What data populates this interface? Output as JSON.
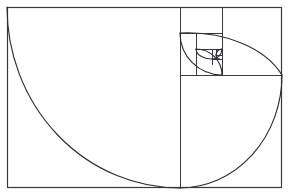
{
  "figure": {
    "background_color": "#ffffff",
    "line_color": "#3a3a3e",
    "spiral_color": "#2e2e33",
    "canvas": {
      "width": 289,
      "height": 196
    }
  },
  "chart_data": {
    "type": "diagram",
    "subtitle": "",
    "xlabel": "",
    "ylabel": "",
    "grid": false,
    "legend": "none",
    "ratio": 1.618,
    "outer_rect": {
      "x": 7,
      "y": 7,
      "width": 275,
      "height": 181
    },
    "squares": [
      {
        "index": 0,
        "x": 180,
        "y": 7,
        "size": 102,
        "corner": "bottom-left",
        "arc_from": [
          7,
          7
        ],
        "arc_to": [
          180,
          188
        ]
      },
      {
        "index": 1,
        "x": 180,
        "y": 7,
        "size": 42,
        "corner": "bottom-right",
        "arc_from": [
          180,
          188
        ],
        "arc_to": [
          282,
          75
        ]
      },
      {
        "index": 2,
        "x": 180,
        "y": 33,
        "size": 42,
        "corner": "top-right",
        "arc_from": [
          282,
          75
        ],
        "arc_to": [
          180,
          33
        ]
      },
      {
        "index": 3,
        "x": 196,
        "y": 33,
        "size": 26,
        "corner": "top-left",
        "arc_from": [
          180,
          33
        ],
        "arc_to": [
          222,
          75
        ]
      },
      {
        "index": 4,
        "x": 196,
        "y": 49,
        "size": 26,
        "corner": "bottom-left",
        "arc_from": [
          222,
          75
        ],
        "arc_to": [
          196,
          49
        ]
      },
      {
        "index": 5,
        "x": 196,
        "y": 49,
        "size": 16,
        "corner": "bottom-right",
        "arc_from": [
          196,
          49
        ],
        "arc_to": [
          222,
          59
        ]
      },
      {
        "index": 6,
        "x": 212,
        "y": 49,
        "size": 10,
        "corner": "top-right",
        "arc_from": [
          222,
          59
        ],
        "arc_to": [
          212,
          49
        ]
      },
      {
        "index": 7,
        "x": 212,
        "y": 55,
        "size": 6,
        "corner": "top-left",
        "arc_from": [
          212,
          49
        ],
        "arc_to": [
          222,
          59
        ]
      },
      {
        "index": 8,
        "x": 216,
        "y": 55,
        "size": 4,
        "corner": "bottom-left",
        "arc_from": [
          222,
          59
        ],
        "arc_to": [
          216,
          55
        ]
      }
    ],
    "divider_lines": [
      {
        "name": "main-vertical-divider",
        "x1": 180,
        "y1": 7,
        "x2": 180,
        "y2": 188
      },
      {
        "name": "right-square-horizontal-divider",
        "x1": 180,
        "y1": 75,
        "x2": 282,
        "y2": 75
      },
      {
        "name": "upper-vertical-divider",
        "x1": 222,
        "y1": 7,
        "x2": 222,
        "y2": 75
      },
      {
        "name": "inner-horizontal-divider",
        "x1": 180,
        "y1": 33,
        "x2": 222,
        "y2": 33
      },
      {
        "name": "inner-vertical-divider",
        "x1": 196,
        "y1": 33,
        "x2": 196,
        "y2": 75
      },
      {
        "name": "inner2-horizontal-divider",
        "x1": 196,
        "y1": 49,
        "x2": 222,
        "y2": 49
      },
      {
        "name": "inner3-vertical-divider",
        "x1": 212,
        "y1": 49,
        "x2": 212,
        "y2": 65
      },
      {
        "name": "inner4-horizontal-divider",
        "x1": 212,
        "y1": 59,
        "x2": 222,
        "y2": 59
      },
      {
        "name": "inner5-vertical-divider",
        "x1": 216,
        "y1": 49,
        "x2": 216,
        "y2": 59
      },
      {
        "name": "inner6-horizontal-divider",
        "x1": 216,
        "y1": 55,
        "x2": 222,
        "y2": 55
      }
    ],
    "arcs": [
      {
        "name": "arc-largest",
        "d": "M 7,7 A 173,181 0 0 0 180,188"
      },
      {
        "name": "arc-2",
        "d": "M 180,188 A 102,113 0 0 0 282,75"
      },
      {
        "name": "arc-3",
        "d": "M 282,75 A 102,68 0 0 0 180,33"
      },
      {
        "name": "arc-4",
        "d": "M 180,33 A 42,42 0 0 0 222,75"
      },
      {
        "name": "arc-5",
        "d": "M 222,75 A 26,26 0 0 0 196,49"
      },
      {
        "name": "arc-6",
        "d": "M 196,49 A 16,10 0 0 0 212,59"
      },
      {
        "name": "arc-7",
        "d": "M 212,59 A 10,10 0 0 0 222,49"
      },
      {
        "name": "arc-8",
        "d": "M 222,49 A 6,6 0 0 0 216,55"
      },
      {
        "name": "arc-9",
        "d": "M 216,55 A 4,4 0 0 0 220,59"
      }
    ]
  }
}
